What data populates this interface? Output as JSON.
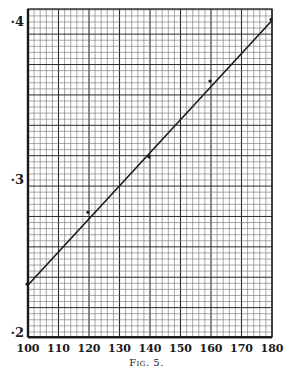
{
  "chart_data": {
    "type": "line",
    "title": "",
    "caption": "Fig. 5.",
    "xlabel": "",
    "ylabel": "",
    "xlim": [
      100,
      180
    ],
    "ylim": [
      0.2,
      0.41
    ],
    "x_ticks": [
      100,
      110,
      120,
      130,
      140,
      150,
      160,
      170,
      180
    ],
    "x_tick_labels": [
      "100",
      "110",
      "120",
      "130",
      "140",
      "150",
      "160",
      "170",
      "180"
    ],
    "y_ticks": [
      0.2,
      0.3,
      0.4
    ],
    "y_tick_labels": [
      "·2",
      "·3",
      "·4"
    ],
    "grid": true,
    "legend": null,
    "series": [
      {
        "name": "fitted line",
        "style": "line",
        "x": [
          100,
          180
        ],
        "y": [
          0.2335,
          0.401
        ]
      },
      {
        "name": "observations",
        "style": "points",
        "x": [
          100,
          120,
          140,
          160,
          180
        ],
        "y": [
          0.2335,
          0.279,
          0.314,
          0.362,
          0.401
        ]
      }
    ]
  },
  "figure": {
    "caption": "Fig. 5."
  },
  "colors": {
    "ink": "#1a1a1a",
    "grid_minor": "#6e6e6e",
    "grid_major": "#2a2a2a",
    "paper": "#ffffff"
  }
}
